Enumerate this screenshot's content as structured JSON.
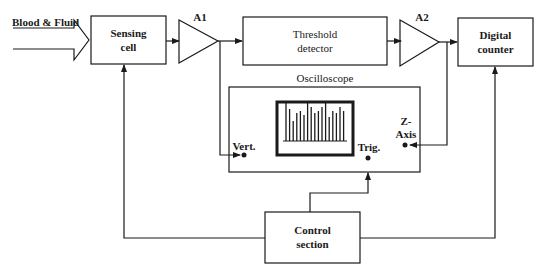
{
  "diagram": {
    "input_label": "Blood & Fluid",
    "blocks": {
      "sensing_cell": "Sensing\ncell",
      "threshold_detector": "Threshold\ndetector",
      "digital_counter": "Digital\ncounter",
      "control_section": "Control\nsection",
      "oscilloscope": "Oscilloscope"
    },
    "amplifiers": {
      "a1": "A1",
      "a2": "A2"
    },
    "oscilloscope_inputs": {
      "vert": "Vert.",
      "trig": "Trig.",
      "z_axis": "Z-\nAxis"
    },
    "screen_bar_heights": [
      38,
      32,
      20,
      28,
      30,
      26,
      38,
      34,
      28,
      30,
      34,
      38,
      24,
      30,
      28,
      34,
      30
    ]
  }
}
